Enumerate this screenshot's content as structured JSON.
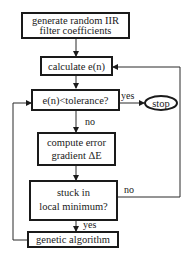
{
  "flowchart": {
    "nodes": [
      {
        "id": "generate",
        "type": "process",
        "lines": [
          "generate random IIR",
          "filter coefficients"
        ]
      },
      {
        "id": "calculate",
        "type": "process",
        "lines": [
          "calculate e(n)"
        ]
      },
      {
        "id": "tolerance",
        "type": "decision",
        "lines": [
          "e(n)<tolerance?"
        ]
      },
      {
        "id": "stop",
        "type": "terminal",
        "lines": [
          "stop"
        ]
      },
      {
        "id": "gradient",
        "type": "process",
        "lines": [
          "compute error",
          "gradient ΔE"
        ]
      },
      {
        "id": "stuck",
        "type": "decision",
        "lines": [
          "stuck in",
          "local minimum?"
        ]
      },
      {
        "id": "genetic",
        "type": "process",
        "lines": [
          "genetic algorithm"
        ]
      }
    ],
    "edges": [
      {
        "from": "generate",
        "to": "calculate",
        "label": ""
      },
      {
        "from": "calculate",
        "to": "tolerance",
        "label": ""
      },
      {
        "from": "tolerance",
        "to": "stop",
        "label": "yes"
      },
      {
        "from": "tolerance",
        "to": "gradient",
        "label": "no"
      },
      {
        "from": "gradient",
        "to": "stuck",
        "label": ""
      },
      {
        "from": "stuck",
        "to": "calculate",
        "label": "no"
      },
      {
        "from": "stuck",
        "to": "genetic",
        "label": "yes"
      },
      {
        "from": "genetic",
        "to": "tolerance",
        "label": ""
      }
    ],
    "labels": {
      "yes_stop": "yes",
      "no_gradient": "no",
      "no_loop": "no",
      "yes_genetic": "yes"
    }
  },
  "colors": {
    "stroke": "#1a1a1a",
    "background": "#ffffff"
  }
}
